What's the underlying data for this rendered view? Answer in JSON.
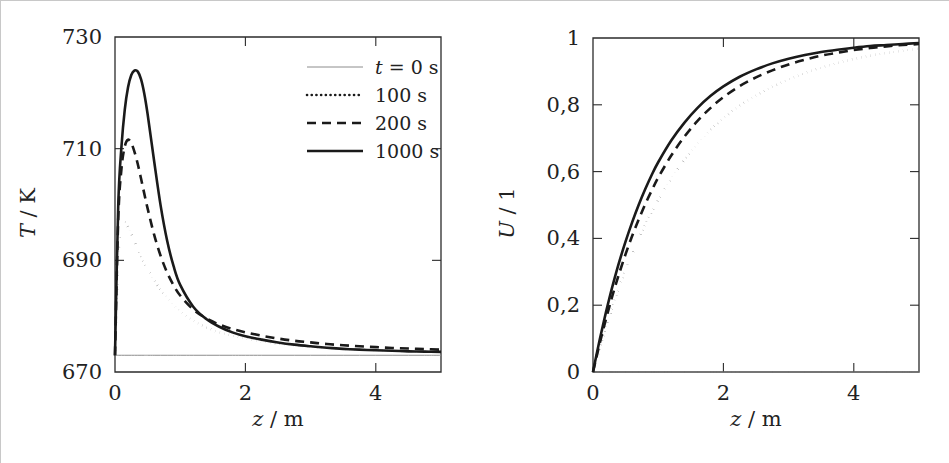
{
  "figure": {
    "background_color": "#ffffff",
    "line_color": "#1a1a1a",
    "axis_color": "#2b2b2b",
    "baseline_color": "#8c8c8c",
    "panels": [
      "temperature-panel",
      "conversion-panel"
    ]
  },
  "chart_data": [
    {
      "id": "temperature-panel",
      "type": "line",
      "title": "",
      "xlabel": "z / m",
      "xlabel_symbol": "z",
      "xlabel_unit": "m",
      "ylabel": "T / K",
      "ylabel_symbol": "T",
      "ylabel_unit": "K",
      "xlim": [
        0,
        5
      ],
      "ylim": [
        670,
        730
      ],
      "xticks": [
        0,
        2,
        4
      ],
      "xticklabels": [
        "0",
        "2",
        "4"
      ],
      "yticks": [
        670,
        690,
        710,
        730
      ],
      "yticklabels": [
        "670",
        "690",
        "710",
        "730"
      ],
      "grid": false,
      "legend_position": "upper-right",
      "legend_entries": [
        {
          "label": "t = 0 s",
          "label_prefix": "t",
          "label_rest": " = 0 s",
          "style": "thin-solid"
        },
        {
          "label": "100 s",
          "label_prefix": "",
          "label_rest": "100 s",
          "style": "dotted"
        },
        {
          "label": "200 s",
          "label_prefix": "",
          "label_rest": "200 s",
          "style": "dashed"
        },
        {
          "label": "1000 s",
          "label_prefix": "",
          "label_rest": "1000 s",
          "style": "thick-solid"
        }
      ],
      "x": [
        0,
        0.05,
        0.1,
        0.15,
        0.2,
        0.25,
        0.3,
        0.35,
        0.4,
        0.45,
        0.5,
        0.6,
        0.7,
        0.8,
        0.9,
        1.0,
        1.2,
        1.4,
        1.6,
        1.8,
        2.0,
        2.25,
        2.5,
        2.75,
        3.0,
        3.25,
        3.5,
        3.75,
        4.0,
        4.25,
        4.5,
        4.75,
        5.0
      ],
      "series": [
        {
          "name": "t = 0 s",
          "style": "thin-solid",
          "values": [
            673,
            673,
            673,
            673,
            673,
            673,
            673,
            673,
            673,
            673,
            673,
            673,
            673,
            673,
            673,
            673,
            673,
            673,
            673,
            673,
            673,
            673,
            673,
            673,
            673,
            673,
            673,
            673,
            673,
            673,
            673,
            673,
            673
          ]
        },
        {
          "name": "100 s",
          "style": "dotted",
          "values": [
            673,
            690.5,
            696.2,
            696.8,
            696.0,
            694.8,
            693.4,
            692.0,
            690.7,
            689.5,
            688.4,
            686.4,
            684.7,
            683.3,
            682.0,
            680.9,
            679.2,
            678.0,
            677.1,
            676.5,
            676.0,
            675.5,
            675.1,
            674.8,
            674.5,
            674.3,
            674.1,
            674.0,
            673.9,
            673.8,
            673.7,
            673.65,
            673.6
          ]
        },
        {
          "name": "200 s",
          "style": "dashed",
          "values": [
            673,
            697.5,
            706.5,
            710.4,
            711.6,
            711.0,
            709.4,
            707.2,
            704.6,
            701.9,
            699.3,
            694.6,
            690.8,
            687.8,
            685.5,
            683.7,
            681.2,
            679.6,
            678.5,
            677.7,
            677.1,
            676.5,
            676.0,
            675.6,
            675.3,
            675.0,
            674.8,
            674.6,
            674.45,
            674.3,
            674.2,
            674.1,
            674.0
          ]
        },
        {
          "name": "1000 s",
          "style": "thick-solid",
          "values": [
            673,
            700.0,
            710.5,
            717.0,
            721.0,
            723.2,
            724.0,
            723.8,
            722.4,
            719.8,
            716.2,
            707.8,
            699.8,
            693.5,
            688.9,
            685.6,
            681.7,
            679.5,
            678.1,
            677.1,
            676.4,
            675.8,
            675.3,
            674.9,
            674.6,
            674.35,
            674.15,
            674.0,
            673.9,
            673.8,
            673.7,
            673.65,
            673.6
          ]
        }
      ]
    },
    {
      "id": "conversion-panel",
      "type": "line",
      "title": "",
      "xlabel": "z / m",
      "xlabel_symbol": "z",
      "xlabel_unit": "m",
      "ylabel": "U / 1",
      "ylabel_symbol": "U",
      "ylabel_unit": "1",
      "xlim": [
        0,
        5
      ],
      "ylim": [
        0,
        1
      ],
      "xticks": [
        0,
        2,
        4
      ],
      "xticklabels": [
        "0",
        "2",
        "4"
      ],
      "yticks": [
        0,
        0.2,
        0.4,
        0.6,
        0.8,
        1
      ],
      "yticklabels": [
        "0",
        "0,2",
        "0,4",
        "0,6",
        "0,8",
        "1"
      ],
      "grid": false,
      "legend_position": "none",
      "legend_entries": [],
      "x": [
        0,
        0.05,
        0.1,
        0.15,
        0.2,
        0.25,
        0.3,
        0.4,
        0.5,
        0.6,
        0.7,
        0.8,
        0.9,
        1.0,
        1.2,
        1.4,
        1.6,
        1.8,
        2.0,
        2.25,
        2.5,
        2.75,
        3.0,
        3.25,
        3.5,
        3.75,
        4.0,
        4.25,
        4.5,
        4.75,
        5.0
      ],
      "series": [
        {
          "name": "t = 0 s",
          "style": "thin-solid",
          "values": [
            0,
            0,
            0,
            0,
            0,
            0,
            0,
            0,
            0,
            0,
            0,
            0,
            0,
            0,
            0,
            0,
            0,
            0,
            0,
            0,
            0,
            0,
            0,
            0,
            0,
            0,
            0,
            0,
            0,
            0,
            0
          ]
        },
        {
          "name": "100 s",
          "style": "dotted",
          "values": [
            0,
            0.035,
            0.07,
            0.103,
            0.135,
            0.166,
            0.196,
            0.253,
            0.305,
            0.353,
            0.398,
            0.44,
            0.479,
            0.515,
            0.579,
            0.635,
            0.683,
            0.724,
            0.76,
            0.797,
            0.828,
            0.854,
            0.876,
            0.895,
            0.911,
            0.925,
            0.937,
            0.947,
            0.955,
            0.962,
            0.968
          ]
        },
        {
          "name": "200 s",
          "style": "dashed",
          "values": [
            0,
            0.042,
            0.083,
            0.122,
            0.159,
            0.195,
            0.23,
            0.294,
            0.353,
            0.407,
            0.456,
            0.502,
            0.543,
            0.582,
            0.648,
            0.704,
            0.751,
            0.79,
            0.823,
            0.856,
            0.882,
            0.903,
            0.921,
            0.935,
            0.947,
            0.956,
            0.964,
            0.97,
            0.975,
            0.979,
            0.982
          ]
        },
        {
          "name": "1000 s",
          "style": "thick-solid",
          "values": [
            0,
            0.048,
            0.094,
            0.138,
            0.18,
            0.22,
            0.258,
            0.328,
            0.391,
            0.448,
            0.5,
            0.547,
            0.59,
            0.628,
            0.693,
            0.746,
            0.79,
            0.826,
            0.855,
            0.884,
            0.906,
            0.924,
            0.938,
            0.949,
            0.958,
            0.965,
            0.971,
            0.976,
            0.979,
            0.982,
            0.985
          ]
        }
      ]
    }
  ]
}
